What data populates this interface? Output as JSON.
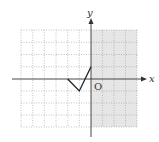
{
  "diagram": {
    "type": "coordinate-grid",
    "axes": {
      "x_label": "x",
      "y_label": "y",
      "origin_label": "O"
    },
    "grid": {
      "x_min": -6,
      "x_max": 4,
      "y_min": -4,
      "y_max": 4,
      "style": "dotted"
    },
    "shaded_region": {
      "description": "x >= 0",
      "color": "#e6e6e6"
    },
    "polyline": {
      "points": [
        [
          -2,
          0
        ],
        [
          -1,
          -1
        ],
        [
          0,
          1
        ]
      ],
      "color": "#222222"
    }
  }
}
